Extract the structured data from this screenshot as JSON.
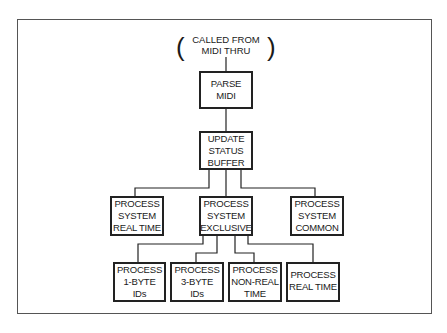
{
  "diagram": {
    "entry": {
      "lines": [
        "CALLED FROM",
        "MIDI THRU"
      ],
      "paren_open": "(",
      "paren_close": ")"
    },
    "nodes": {
      "parse": {
        "lines": [
          "PARSE",
          "MIDI"
        ]
      },
      "update": {
        "lines": [
          "UPDATE",
          "STATUS",
          "BUFFER"
        ]
      },
      "sys_realtime": {
        "lines": [
          "PROCESS",
          "SYSTEM",
          "REAL TIME"
        ]
      },
      "sys_exclusive": {
        "lines": [
          "PROCESS",
          "SYSTEM",
          "EXCLUSIVE"
        ]
      },
      "sys_common": {
        "lines": [
          "PROCESS",
          "SYSTEM",
          "COMMON"
        ]
      },
      "one_byte": {
        "lines": [
          "PROCESS",
          "1-BYTE",
          "IDs"
        ]
      },
      "three_byte": {
        "lines": [
          "PROCESS",
          "3-BYTE",
          "IDs"
        ]
      },
      "non_realtime": {
        "lines": [
          "PROCESS",
          "NON-REAL",
          "TIME"
        ]
      },
      "realtime": {
        "lines": [
          "PROCESS",
          "REAL TIME"
        ]
      }
    },
    "edges": [
      [
        "entry",
        "parse"
      ],
      [
        "parse",
        "update"
      ],
      [
        "update",
        "sys_realtime"
      ],
      [
        "update",
        "sys_exclusive"
      ],
      [
        "update",
        "sys_common"
      ],
      [
        "sys_exclusive",
        "one_byte"
      ],
      [
        "sys_exclusive",
        "three_byte"
      ],
      [
        "sys_exclusive",
        "non_realtime"
      ],
      [
        "sys_exclusive",
        "realtime"
      ]
    ]
  }
}
